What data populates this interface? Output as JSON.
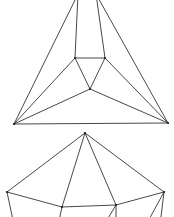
{
  "diagram": {
    "colors": {
      "edge": "#333333",
      "vertex": "#222222",
      "background": "#ffffff"
    },
    "figures": [
      {
        "name": "top-graph",
        "vertices": {
          "T1": [
            78,
            -6
          ],
          "T2": [
            96,
            -6
          ],
          "L": [
            14,
            124
          ],
          "R": [
            168,
            123
          ],
          "A": [
            75,
            58
          ],
          "B": [
            105,
            58
          ],
          "C": [
            90,
            89
          ]
        },
        "edges": [
          [
            "L",
            "T1"
          ],
          [
            "R",
            "T2"
          ],
          [
            "L",
            "R"
          ],
          [
            "T1",
            "A"
          ],
          [
            "T2",
            "B"
          ],
          [
            "A",
            "B"
          ],
          [
            "B",
            "C"
          ],
          [
            "C",
            "A"
          ],
          [
            "L",
            "A"
          ],
          [
            "L",
            "C"
          ],
          [
            "R",
            "B"
          ],
          [
            "R",
            "C"
          ]
        ],
        "dots": [
          "A",
          "B",
          "C",
          "L",
          "R"
        ]
      },
      {
        "name": "bottom-graph",
        "vertices": {
          "P": [
            85,
            133
          ],
          "Q": [
            7,
            192
          ],
          "S": [
            164,
            192
          ],
          "U": [
            62,
            207
          ],
          "V": [
            116,
            205
          ],
          "QB": [
            14,
            225
          ],
          "UB": [
            58,
            225
          ],
          "VB1": [
            104,
            225
          ],
          "VB2": [
            116,
            225
          ],
          "SB1": [
            146,
            225
          ],
          "SB2": [
            160,
            225
          ]
        },
        "edges": [
          [
            "P",
            "Q"
          ],
          [
            "P",
            "U"
          ],
          [
            "P",
            "V"
          ],
          [
            "P",
            "S"
          ],
          [
            "Q",
            "U"
          ],
          [
            "U",
            "V"
          ],
          [
            "V",
            "S"
          ],
          [
            "Q",
            "QB"
          ],
          [
            "U",
            "UB"
          ],
          [
            "V",
            "VB1"
          ],
          [
            "V",
            "VB2"
          ],
          [
            "S",
            "SB1"
          ],
          [
            "S",
            "SB2"
          ]
        ],
        "dots": [
          "P",
          "Q",
          "S",
          "U",
          "V"
        ]
      }
    ]
  }
}
